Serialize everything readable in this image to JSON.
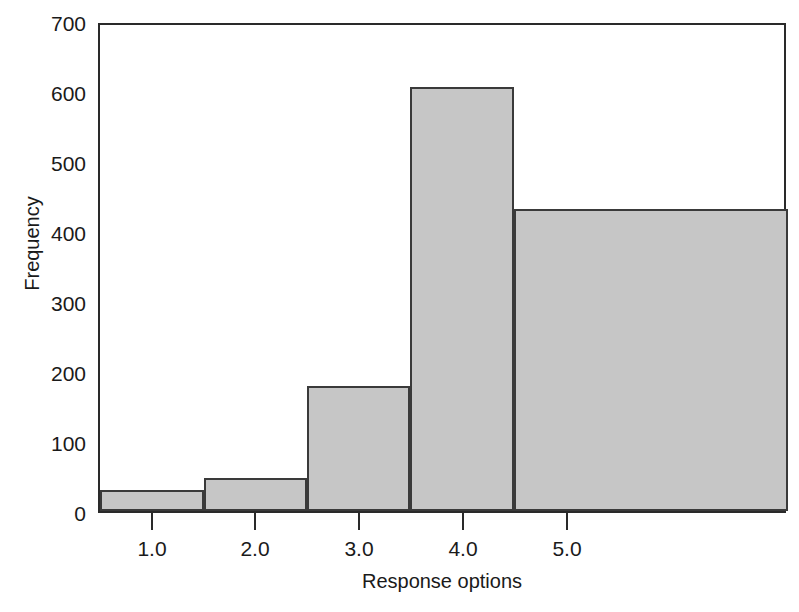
{
  "chart_data": {
    "type": "bar",
    "title": "",
    "subtitle": "",
    "xlabel": "Response options",
    "ylabel": "Frequency",
    "categories": [
      "1.0",
      "2.0",
      "3.0",
      "4.0",
      "5.0"
    ],
    "values": [
      30,
      48,
      180,
      610,
      435
    ],
    "x": [
      1.0,
      2.0,
      3.0,
      4.0,
      5.0
    ],
    "xlim": [
      0.5,
      5.5
    ],
    "ylim": [
      0,
      700
    ],
    "yticks": [
      0,
      100,
      200,
      300,
      400,
      500,
      600,
      700
    ],
    "ytick_labels": [
      "0",
      "100",
      "200",
      "300",
      "400",
      "500",
      "600",
      "700"
    ],
    "xticks": [
      1.0,
      2.0,
      3.0,
      4.0,
      5.0
    ],
    "xtick_labels": [
      "1.0",
      "2.0",
      "3.0",
      "4.0",
      "5.0"
    ],
    "grid": false,
    "legend": null,
    "legend_position": "none",
    "bar_fill_color": "#c6c6c6",
    "bar_edge_color": "#3a3a3a",
    "axis_color": "#2a2a2a",
    "background_color": "#ffffff",
    "bar_width_data_units": 1.0,
    "annotations": []
  },
  "axes": {
    "y": {
      "label": "Frequency",
      "ticks": [
        {
          "value": 700,
          "label": "700"
        },
        {
          "value": 600,
          "label": "600"
        },
        {
          "value": 500,
          "label": "500"
        },
        {
          "value": 400,
          "label": "400"
        },
        {
          "value": 300,
          "label": "300"
        },
        {
          "value": 200,
          "label": "200"
        },
        {
          "value": 100,
          "label": "100"
        },
        {
          "value": 0,
          "label": "0"
        }
      ]
    },
    "x": {
      "label": "Response options",
      "ticks": [
        {
          "value": 1.0,
          "label": "1.0"
        },
        {
          "value": 2.0,
          "label": "2.0"
        },
        {
          "value": 3.0,
          "label": "3.0"
        },
        {
          "value": 4.0,
          "label": "4.0"
        },
        {
          "value": 5.0,
          "label": "5.0"
        }
      ]
    }
  }
}
